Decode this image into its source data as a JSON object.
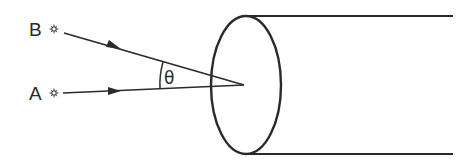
{
  "diagram": {
    "colors": {
      "ink": "#2a2a2a",
      "background": "#ffffff"
    },
    "sources": [
      {
        "label": "B",
        "icon": "star-source-icon",
        "x": 54,
        "y": 29
      },
      {
        "label": "A",
        "icon": "star-source-icon",
        "x": 54,
        "y": 93
      }
    ],
    "rays": [
      {
        "from": "B",
        "x1": 64,
        "y1": 33,
        "x2": 244,
        "y2": 85,
        "arrow_at": [
          118,
          48
        ]
      },
      {
        "from": "A",
        "x1": 63,
        "y1": 93,
        "x2": 244,
        "y2": 85,
        "arrow_at": [
          118,
          91
        ]
      }
    ],
    "angle": {
      "symbol": "θ",
      "vertex": [
        244,
        85
      ],
      "label_x": 162,
      "label_y": 84
    },
    "tube": {
      "aperture": {
        "cx": 246,
        "cy": 85,
        "rx": 35,
        "ry": 69
      },
      "top_edge": {
        "x1": 246,
        "y1": 16,
        "x2": 453,
        "y2": 16
      },
      "bottom_edge": {
        "x1": 246,
        "y1": 154,
        "x2": 453,
        "y2": 154
      }
    }
  }
}
